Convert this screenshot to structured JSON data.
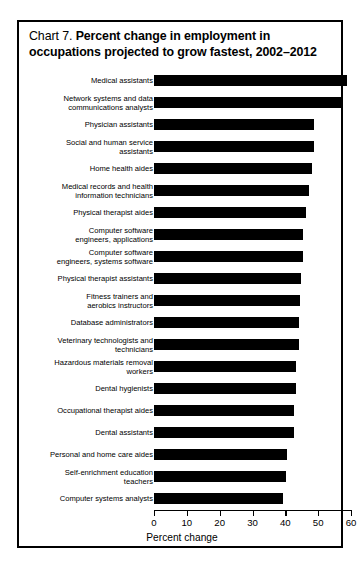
{
  "chart_data": {
    "type": "bar",
    "orientation": "horizontal",
    "title_prefix": "Chart 7.",
    "title": "Percent change in employment in occupations projected to grow fastest, 2002–2012",
    "xlabel": "Percent change",
    "ylabel": "",
    "xlim": [
      0,
      60
    ],
    "xticks": [
      0,
      10,
      20,
      30,
      40,
      50,
      60
    ],
    "xtick_labels": [
      "0",
      "10",
      "20",
      "30",
      "40",
      "50",
      "60"
    ],
    "grid": false,
    "legend": null,
    "bar_color": "#000000",
    "categories": [
      "Medical assistants",
      "Network systems and data\ncommunications analysts",
      "Physician assistants",
      "Social and human service\nassistants",
      "Home health aides",
      "Medical records and health\ninformation technicians",
      "Physical therapist aides",
      "Computer software\nengineers, applications",
      "Computer software\nengineers, systems software",
      "Physical therapist assistants",
      "Fitness trainers and\naerobics instructors",
      "Database administrators",
      "Veterinary technologists and\ntechnicians",
      "Hazardous materials removal\nworkers",
      "Dental hygienists",
      "Occupational therapist aides",
      "Dental assistants",
      "Personal and home care aides",
      "Self-enrichment education\nteachers",
      "Computer systems analysts"
    ],
    "values": [
      58.9,
      57.0,
      48.8,
      48.7,
      48.1,
      47.1,
      46.3,
      45.5,
      45.5,
      44.8,
      44.5,
      44.2,
      44.1,
      43.1,
      43.1,
      42.6,
      42.5,
      40.5,
      40.2,
      39.4
    ]
  }
}
